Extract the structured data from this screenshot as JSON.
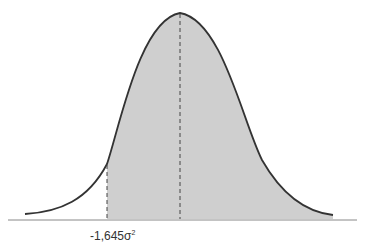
{
  "diagram": {
    "type": "normal-distribution-curve",
    "critical_value_label": "-1,645σ",
    "critical_value_superscript": "2",
    "shaded_region": "right of critical value",
    "colors": {
      "curve": "#333333",
      "fill": "#cfcfcf",
      "baseline": "#888888",
      "dashed": "#444444"
    }
  }
}
